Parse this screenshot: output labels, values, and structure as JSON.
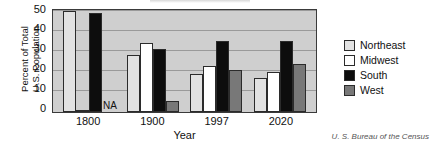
{
  "chart_data": {
    "type": "bar",
    "title": "",
    "xlabel": "Year",
    "ylabel_line1": "Percent of Total",
    "ylabel_line2": "U.S. Population",
    "categories": [
      "1800",
      "1900",
      "1997",
      "2020"
    ],
    "yticks": [
      "0",
      "10",
      "20",
      "30",
      "40",
      "50"
    ],
    "ylim": [
      0,
      50
    ],
    "grid": true,
    "legend_position": "right",
    "annotations": [
      {
        "text": "NA",
        "category": "1800",
        "series": "West"
      }
    ],
    "series": [
      {
        "name": "Northeast",
        "color": "#e2e2e2",
        "values": [
          50,
          28,
          19,
          17
        ]
      },
      {
        "name": "Midwest",
        "color": "#ffffff",
        "values": [
          1,
          34,
          23,
          20
        ]
      },
      {
        "name": "South",
        "color": "#0d0d0d",
        "values": [
          49,
          31,
          35,
          35
        ]
      },
      {
        "name": "West",
        "color": "#787878",
        "values": [
          null,
          5.5,
          21,
          24
        ]
      }
    ]
  },
  "source": "U. S. Bureau of the Census",
  "colors": {
    "plot_background": "#cfcfcf",
    "gridline": "#9a9a9a",
    "axis": "#3a3a3a",
    "text": "#111111"
  }
}
